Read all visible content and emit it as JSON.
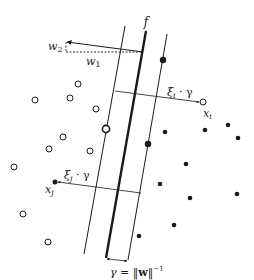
{
  "diagram": {
    "type": "svm-soft-margin",
    "colors": {
      "stroke": "#1a1a1a",
      "background": "#ffffff",
      "label": "#222222"
    },
    "labels": {
      "f": "f",
      "w2": "w",
      "w2_sub": "2",
      "w1": "w",
      "w1_sub": "1",
      "xi_i": "ξ",
      "xi_i_sub": "i",
      "xi_i_rest": " · γ",
      "x_i": "x",
      "x_i_sub": "i",
      "xi_j": "ξ",
      "xi_j_sub": "j",
      "xi_j_rest": " · γ",
      "x_j": "x",
      "x_j_sub": "j",
      "gamma_eq": "γ = ‖",
      "gamma_w": "w",
      "gamma_close": "‖",
      "gamma_exp": "−1"
    },
    "lines": {
      "decision_boundary": {
        "x1": 146,
        "y1": 31,
        "x2": 106,
        "y2": 258,
        "width": 2.4
      },
      "left_margin": {
        "x1": 125,
        "y1": 26,
        "x2": 84,
        "y2": 254,
        "width": 1
      },
      "right_margin": {
        "x1": 167,
        "y1": 34,
        "x2": 128,
        "y2": 260,
        "width": 1
      }
    },
    "open_points": [
      [
        78,
        84
      ],
      [
        35,
        100
      ],
      [
        70,
        98
      ],
      [
        96,
        109
      ],
      [
        63,
        137
      ],
      [
        49,
        149
      ],
      [
        90,
        151
      ],
      [
        14,
        167
      ],
      [
        23,
        214
      ],
      [
        48,
        242
      ]
    ],
    "open_support_vectors": [
      [
        106,
        129
      ]
    ],
    "filled_points": [
      [
        165,
        132
      ],
      [
        205,
        130
      ],
      [
        228,
        125
      ],
      [
        238,
        138
      ],
      [
        186,
        164
      ],
      [
        160,
        184
      ],
      [
        190,
        198
      ],
      [
        237,
        194
      ],
      [
        174,
        225
      ],
      [
        139,
        236
      ]
    ],
    "filled_support_vectors": [
      [
        163,
        60
      ],
      [
        148,
        144
      ]
    ],
    "x_i_point": [
      203,
      102
    ],
    "x_j_point": [
      55,
      182
    ]
  }
}
